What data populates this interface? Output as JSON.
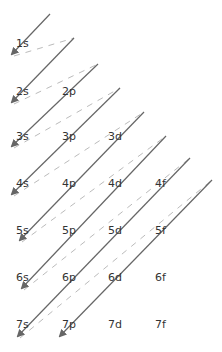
{
  "colors": {
    "arrow": "#666666",
    "dashed": "#bbbbbb",
    "text": "#333333"
  },
  "layout": {
    "col_x": {
      "s": 16,
      "p": 62,
      "d": 108,
      "f": 155
    },
    "row_y": {
      "1": 44,
      "2": 92,
      "3": 137,
      "4": 184,
      "5": 231,
      "6": 278,
      "7": 325
    }
  },
  "orbitals": [
    {
      "label": "1s",
      "n": 1,
      "l": "s"
    },
    {
      "label": "2s",
      "n": 2,
      "l": "s"
    },
    {
      "label": "2p",
      "n": 2,
      "l": "p"
    },
    {
      "label": "3s",
      "n": 3,
      "l": "s"
    },
    {
      "label": "3p",
      "n": 3,
      "l": "p"
    },
    {
      "label": "3d",
      "n": 3,
      "l": "d"
    },
    {
      "label": "4s",
      "n": 4,
      "l": "s"
    },
    {
      "label": "4p",
      "n": 4,
      "l": "p"
    },
    {
      "label": "4d",
      "n": 4,
      "l": "d"
    },
    {
      "label": "4f",
      "n": 4,
      "l": "f"
    },
    {
      "label": "5s",
      "n": 5,
      "l": "s"
    },
    {
      "label": "5p",
      "n": 5,
      "l": "p"
    },
    {
      "label": "5d",
      "n": 5,
      "l": "d"
    },
    {
      "label": "5f",
      "n": 5,
      "l": "f"
    },
    {
      "label": "6s",
      "n": 6,
      "l": "s"
    },
    {
      "label": "6p",
      "n": 6,
      "l": "p"
    },
    {
      "label": "6d",
      "n": 6,
      "l": "d"
    },
    {
      "label": "6f",
      "n": 6,
      "l": "f"
    },
    {
      "label": "7s",
      "n": 7,
      "l": "s"
    },
    {
      "label": "7p",
      "n": 7,
      "l": "p"
    },
    {
      "label": "7d",
      "n": 7,
      "l": "d"
    },
    {
      "label": "7f",
      "n": 7,
      "l": "f"
    }
  ],
  "arrows": [
    {
      "from": [
        50,
        14
      ],
      "to": [
        12,
        54
      ]
    },
    {
      "from": [
        74,
        38
      ],
      "to": [
        12,
        102
      ]
    },
    {
      "from": [
        98,
        64
      ],
      "to": [
        12,
        146
      ]
    },
    {
      "from": [
        120,
        88
      ],
      "to": [
        12,
        194
      ]
    },
    {
      "from": [
        144,
        112
      ],
      "to": [
        20,
        240
      ]
    },
    {
      "from": [
        166,
        136
      ],
      "to": [
        22,
        288
      ]
    },
    {
      "from": [
        190,
        158
      ],
      "to": [
        18,
        336
      ]
    },
    {
      "from": [
        212,
        180
      ],
      "to": [
        60,
        336
      ]
    }
  ],
  "dashed_links": [
    {
      "from": [
        14,
        56
      ],
      "to": [
        74,
        38
      ]
    },
    {
      "from": [
        14,
        104
      ],
      "to": [
        98,
        64
      ]
    },
    {
      "from": [
        14,
        148
      ],
      "to": [
        120,
        88
      ]
    },
    {
      "from": [
        14,
        196
      ],
      "to": [
        144,
        112
      ]
    },
    {
      "from": [
        22,
        242
      ],
      "to": [
        166,
        136
      ]
    },
    {
      "from": [
        24,
        290
      ],
      "to": [
        190,
        158
      ]
    },
    {
      "from": [
        20,
        338
      ],
      "to": [
        212,
        180
      ]
    }
  ]
}
